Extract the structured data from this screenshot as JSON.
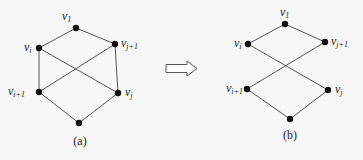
{
  "graphs": [
    {
      "caption": "(a)",
      "nodes": [
        {
          "id": "v1",
          "base": "v",
          "sub": "1",
          "x": 76,
          "y": 28,
          "lx": 62,
          "ly": 20
        },
        {
          "id": "vi",
          "base": "v",
          "sub": "i",
          "x": 39,
          "y": 48,
          "lx": 24,
          "ly": 51
        },
        {
          "id": "vj1",
          "base": "v",
          "sub": "j+1",
          "x": 115,
          "y": 44,
          "lx": 121,
          "ly": 47
        },
        {
          "id": "vi1",
          "base": "v",
          "sub": "i+1",
          "x": 39,
          "y": 92,
          "lx": 8,
          "ly": 95
        },
        {
          "id": "vj",
          "base": "v",
          "sub": "j",
          "x": 118,
          "y": 93,
          "lx": 125,
          "ly": 96
        },
        {
          "id": "bottom",
          "base": "",
          "sub": "",
          "x": 79,
          "y": 123
        }
      ],
      "edges": [
        [
          "v1",
          "vi"
        ],
        [
          "v1",
          "vj1"
        ],
        [
          "vi",
          "vi1"
        ],
        [
          "vi",
          "vj"
        ],
        [
          "vj1",
          "vi1"
        ],
        [
          "vj1",
          "vj"
        ],
        [
          "vi1",
          "bottom"
        ],
        [
          "vj",
          "bottom"
        ]
      ],
      "caption_pos": {
        "x": 80,
        "y": 145
      }
    },
    {
      "caption": "(b)",
      "nodes": [
        {
          "id": "v1",
          "base": "v",
          "sub": "1",
          "x": 285,
          "y": 24,
          "lx": 280,
          "ly": 16
        },
        {
          "id": "vi",
          "base": "v",
          "sub": "i",
          "x": 248,
          "y": 44,
          "lx": 234,
          "ly": 47
        },
        {
          "id": "vj1",
          "base": "v",
          "sub": "j+1",
          "x": 325,
          "y": 42,
          "lx": 331,
          "ly": 45
        },
        {
          "id": "vi1",
          "base": "v",
          "sub": "i+1",
          "x": 247,
          "y": 89,
          "lx": 226,
          "ly": 92
        },
        {
          "id": "vj",
          "base": "v",
          "sub": "j",
          "x": 328,
          "y": 90,
          "lx": 335,
          "ly": 93
        },
        {
          "id": "bottom",
          "base": "",
          "sub": "",
          "x": 290,
          "y": 119
        }
      ],
      "edges": [
        [
          "v1",
          "vi"
        ],
        [
          "v1",
          "vj1"
        ],
        [
          "vi",
          "vj"
        ],
        [
          "vj1",
          "vi1"
        ],
        [
          "vi1",
          "bottom"
        ],
        [
          "vj",
          "bottom"
        ]
      ],
      "caption_pos": {
        "x": 290,
        "y": 139
      }
    }
  ],
  "arrow": {
    "direction": "right",
    "x1": 166,
    "x2": 197,
    "y": 68
  }
}
